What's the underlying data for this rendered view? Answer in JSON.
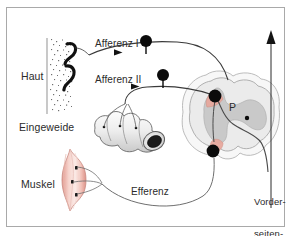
{
  "figure": {
    "language": "de",
    "background_color": "#ffffff",
    "frame_color": "#a9a9a9"
  },
  "labels": {
    "haut": "Haut",
    "eingeweide": "Eingeweide",
    "muskel": "Muskel",
    "afferenz_1": "Afferenz I",
    "afferenz_2": "Afferenz II",
    "efferenz": "Efferenz",
    "vorderseitenstrang_line1": "Vorder-",
    "vorderseitenstrang_line2": "seiten-",
    "vorderseitenstrang_line3": "strang",
    "p_marker": "P"
  },
  "structures": {
    "skin": {
      "name": "Haut",
      "description": "stippled vertical skin band with black hook nerve endings",
      "fill": "#f4f4f4",
      "stipple_color": "#6e6e6e",
      "ending_color": "#111111"
    },
    "viscera": {
      "name": "Eingeweide",
      "description": "segmented intestine with dark lumen opening",
      "fill": "#f2f2f2",
      "outline": "#6a6a6a",
      "lumen": "#1c1c1c"
    },
    "muscle": {
      "name": "Muskel",
      "description": "pink spindle-shaped muscle with receptor marks",
      "fill": "#f0bcb4",
      "fill_light": "#f8ddd8",
      "outline": "#c98a82"
    },
    "spinal_cord": {
      "name": "Rueckenmark",
      "white_matter_fill": "#ebebeb",
      "gray_matter_fill": "#c9c9c9",
      "outline": "#9a9a9a",
      "dorsal_horn_patch": "#e8a79c",
      "ventral_horn_patch": "#e8a79c"
    },
    "tract": {
      "name": "Vorderseitenstrang",
      "direction": "ascending",
      "arrow_color": "#1a1a1a"
    }
  },
  "pathways": [
    {
      "name": "afferenz-i",
      "label": "Afferenz I",
      "from": "Haut",
      "to": "Hinterhorn",
      "arrow": "right",
      "color": "#3a3a3a"
    },
    {
      "name": "afferenz-ii",
      "label": "Afferenz II",
      "from": "Eingeweide",
      "to": "Hinterhorn",
      "arrow": "right",
      "color": "#3a3a3a"
    },
    {
      "name": "efferenz",
      "label": "Efferenz",
      "from": "Vorderhorn",
      "to": "Muskel",
      "arrow": "none",
      "color": "#6f6f6f"
    }
  ],
  "neurons": [
    {
      "name": "ganglion-afferenz-i",
      "cx": 143,
      "cy": 40,
      "r": 6.0,
      "color": "#0b0b0b"
    },
    {
      "name": "ganglion-afferenz-ii",
      "cx": 160,
      "cy": 74,
      "r": 6.0,
      "color": "#0b0b0b"
    },
    {
      "name": "dorsal-horn-neuron",
      "cx": 214,
      "cy": 93,
      "r": 6.2,
      "color": "#0b0b0b"
    },
    {
      "name": "ventral-horn-neuron",
      "cx": 212,
      "cy": 148,
      "r": 6.2,
      "color": "#0b0b0b"
    },
    {
      "name": "p-center-dot",
      "cx": 246,
      "cy": 115,
      "r": 2.2,
      "color": "#0b0b0b"
    }
  ]
}
